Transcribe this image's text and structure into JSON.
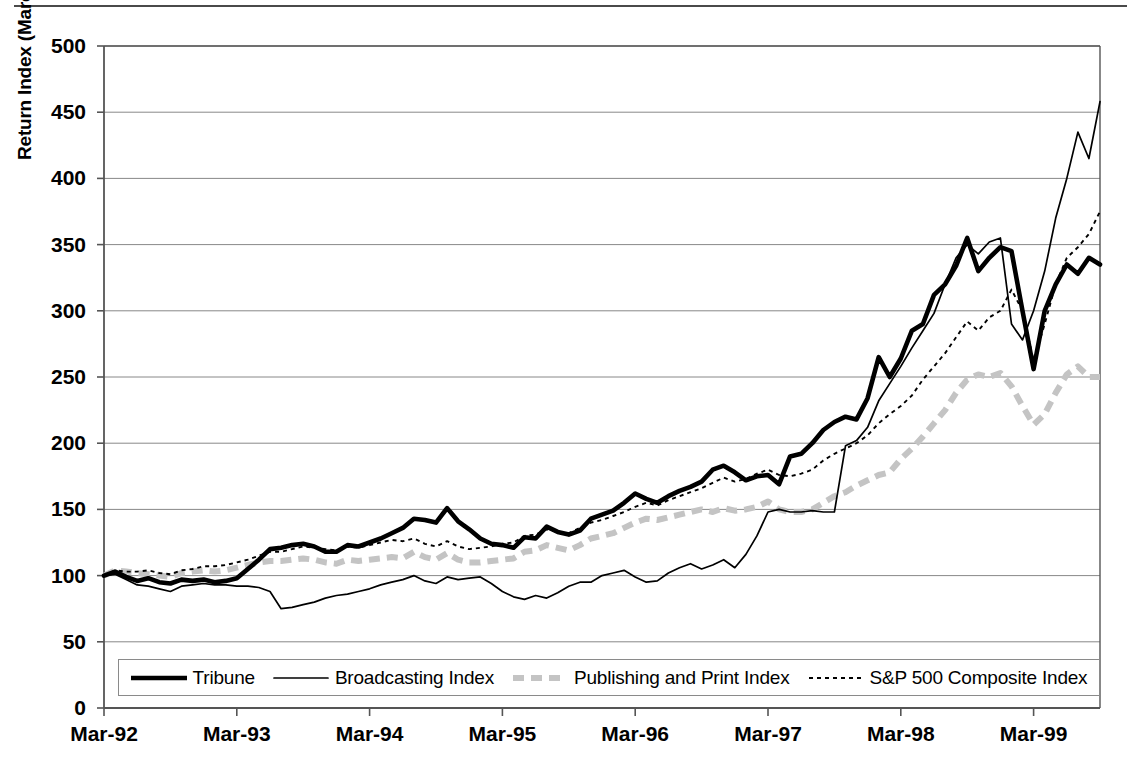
{
  "chart_data": {
    "type": "line",
    "title": "",
    "xlabel": "",
    "ylabel": "Return Index (March 1992 = 100)",
    "ylim": [
      0,
      500
    ],
    "yticks": [
      0,
      50,
      100,
      150,
      200,
      250,
      300,
      350,
      400,
      450,
      500
    ],
    "grid": true,
    "legend_position": "bottom",
    "x_tick_labels": [
      "Mar-92",
      "Mar-93",
      "Mar-94",
      "Mar-95",
      "Mar-96",
      "Mar-97",
      "Mar-98",
      "Mar-99"
    ],
    "x_start": "Mar-92",
    "x_end": "Mar-99",
    "x_points": 85,
    "series": [
      {
        "name": "Tribune",
        "style": "solid-thick-black",
        "color": "#000000",
        "values": [
          100,
          103,
          99,
          96,
          98,
          95,
          94,
          97,
          96,
          97,
          95,
          96,
          98,
          105,
          112,
          120,
          121,
          123,
          124,
          122,
          118,
          118,
          123,
          122,
          125,
          128,
          132,
          136,
          143,
          142,
          140,
          151,
          141,
          135,
          128,
          124,
          123,
          121,
          129,
          128,
          137,
          133,
          131,
          134,
          143,
          146,
          149,
          155,
          162,
          158,
          155,
          160,
          164,
          167,
          171,
          180,
          183,
          178,
          172,
          175,
          176,
          169,
          190,
          192,
          200,
          210,
          216,
          220,
          218,
          234,
          265,
          250,
          264,
          285,
          290,
          312,
          320,
          334,
          355,
          330,
          340,
          348,
          345,
          300,
          256,
          300,
          320,
          335,
          328,
          340,
          335
        ]
      },
      {
        "name": "Broadcasting Index",
        "style": "solid-thin-black",
        "color": "#000000",
        "values": [
          100,
          101,
          97,
          93,
          92,
          90,
          88,
          92,
          93,
          94,
          93,
          93,
          92,
          92,
          91,
          88,
          75,
          76,
          78,
          80,
          83,
          85,
          86,
          88,
          90,
          93,
          95,
          97,
          100,
          96,
          94,
          99,
          97,
          98,
          99,
          94,
          88,
          84,
          82,
          85,
          83,
          87,
          92,
          95,
          95,
          100,
          102,
          104,
          99,
          95,
          96,
          102,
          106,
          109,
          105,
          108,
          112,
          106,
          116,
          130,
          148,
          150,
          148,
          148,
          149,
          148,
          148,
          198,
          202,
          212,
          232,
          245,
          258,
          272,
          285,
          298,
          320,
          340,
          350,
          343,
          352,
          355,
          290,
          278,
          300,
          330,
          370,
          400,
          435,
          415,
          458
        ]
      },
      {
        "name": "Publishing and Print Index",
        "style": "dashed-thick-gray",
        "color": "#c4c4c4",
        "values": [
          100,
          104,
          103,
          102,
          101,
          100,
          99,
          102,
          103,
          104,
          103,
          104,
          106,
          108,
          110,
          111,
          111,
          112,
          113,
          112,
          110,
          109,
          112,
          111,
          112,
          113,
          114,
          113,
          118,
          114,
          112,
          117,
          112,
          110,
          110,
          111,
          112,
          113,
          118,
          119,
          123,
          121,
          119,
          123,
          128,
          130,
          132,
          136,
          140,
          143,
          142,
          144,
          146,
          148,
          150,
          148,
          151,
          149,
          150,
          152,
          156,
          150,
          148,
          148,
          150,
          155,
          160,
          163,
          168,
          172,
          176,
          178,
          188,
          196,
          205,
          215,
          225,
          238,
          248,
          252,
          250,
          253,
          243,
          228,
          214,
          222,
          238,
          252,
          258,
          250,
          250
        ]
      },
      {
        "name": "S&P 500 Composite Index",
        "style": "dotted-thin-black",
        "color": "#000000",
        "values": [
          100,
          104,
          103,
          103,
          104,
          102,
          101,
          104,
          105,
          107,
          107,
          108,
          110,
          112,
          115,
          118,
          118,
          120,
          122,
          121,
          120,
          119,
          122,
          121,
          123,
          125,
          127,
          126,
          128,
          124,
          122,
          126,
          122,
          120,
          121,
          122,
          124,
          125,
          130,
          131,
          135,
          133,
          132,
          136,
          140,
          142,
          145,
          148,
          152,
          155,
          153,
          157,
          160,
          163,
          166,
          170,
          174,
          171,
          173,
          177,
          180,
          176,
          175,
          177,
          180,
          187,
          192,
          196,
          200,
          206,
          215,
          222,
          228,
          236,
          248,
          258,
          268,
          280,
          292,
          285,
          295,
          300,
          316,
          300,
          262,
          290,
          320,
          340,
          348,
          358,
          375
        ]
      }
    ]
  },
  "legend": {
    "items": [
      {
        "label": "Tribune",
        "swatch": "solid-thick-black"
      },
      {
        "label": "Broadcasting Index",
        "swatch": "solid-thin-black"
      },
      {
        "label": "Publishing and Print Index",
        "swatch": "dashed-thick-gray"
      },
      {
        "label": "S&P 500 Composite Index",
        "swatch": "dotted-thin-black"
      }
    ]
  },
  "colors": {
    "axis": "#555555",
    "grid": "#888888",
    "tribune": "#000000",
    "broadcasting": "#000000",
    "publishing": "#c4c4c4",
    "sp500": "#000000"
  }
}
